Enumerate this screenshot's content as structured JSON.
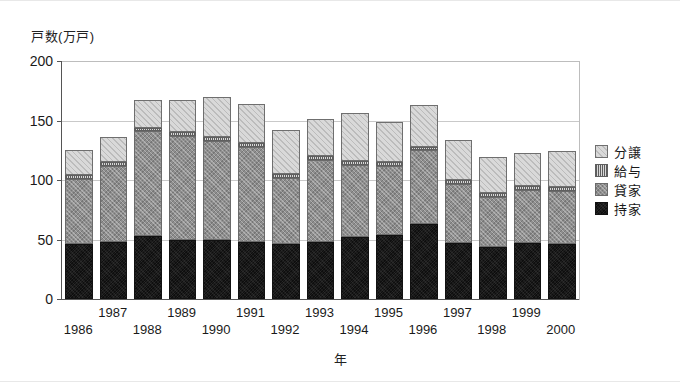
{
  "chart_data": {
    "type": "bar",
    "stacked": true,
    "title": "",
    "ylabel": "戸数(万戸)",
    "xlabel": "年",
    "ylim": [
      0,
      200
    ],
    "yticks": [
      0,
      50,
      100,
      150,
      200
    ],
    "grid": true,
    "legend_position": "right",
    "categories": [
      "1986",
      "1987",
      "1988",
      "1989",
      "1990",
      "1991",
      "1992",
      "1993",
      "1994",
      "1995",
      "1996",
      "1997",
      "1998",
      "1999",
      "2000"
    ],
    "series": [
      {
        "name": "持家",
        "key": "mochiie",
        "color": "#1d1d1d",
        "values": [
          46,
          48,
          53,
          50,
          50,
          48,
          46,
          48,
          52,
          54,
          63,
          47,
          44,
          47,
          46
        ]
      },
      {
        "name": "貸家",
        "key": "kashiya",
        "color": "#8e8e8e",
        "values": [
          55,
          64,
          88,
          87,
          83,
          80,
          56,
          69,
          61,
          58,
          62,
          50,
          42,
          45,
          45
        ]
      },
      {
        "name": "給与",
        "key": "kyuyo",
        "color": "#a5a5a5",
        "values": [
          3,
          3,
          3,
          3,
          3,
          3,
          3,
          3,
          3,
          3,
          3,
          3,
          3,
          3,
          3
        ]
      },
      {
        "name": "分譲",
        "key": "bunjo",
        "color": "#d9d9d9",
        "values": [
          21,
          21,
          23,
          27,
          34,
          33,
          37,
          31,
          40,
          34,
          35,
          34,
          30,
          28,
          30
        ]
      }
    ],
    "totals": [
      125,
      136,
      167,
      167,
      170,
      164,
      142,
      151,
      156,
      149,
      163,
      134,
      119,
      123,
      124
    ]
  },
  "legend": {
    "items": [
      {
        "label": "分譲",
        "key": "bunjo"
      },
      {
        "label": "給与",
        "key": "kyuyo"
      },
      {
        "label": "貸家",
        "key": "kashiya"
      },
      {
        "label": "持家",
        "key": "mochiie"
      }
    ]
  }
}
